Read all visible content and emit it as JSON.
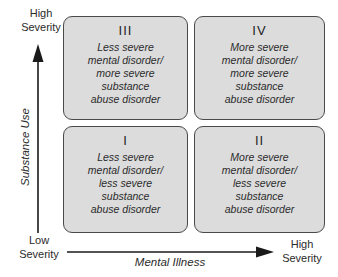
{
  "quadrants": {
    "iii": {
      "numeral": "III",
      "lines": [
        "Less severe",
        "mental disorder/",
        "more severe",
        "substance",
        "abuse disorder"
      ]
    },
    "iv": {
      "numeral": "IV",
      "lines": [
        "More severe",
        "mental disorder/",
        "more severe",
        "substance",
        "abuse disorder"
      ]
    },
    "i": {
      "numeral": "I",
      "lines": [
        "Less severe",
        "mental disorder/",
        "less severe",
        "substance",
        "abuse disorder"
      ]
    },
    "ii": {
      "numeral": "II",
      "lines": [
        "More severe",
        "mental disorder/",
        "less severe",
        "substance",
        "abuse disorder"
      ]
    }
  },
  "axes": {
    "y": {
      "name": "Substance Use",
      "top_label_line1": "High",
      "top_label_line2": "Severity",
      "bottom_label_line1": "Low",
      "bottom_label_line2": "Severity"
    },
    "x": {
      "name": "Mental Illness",
      "right_label_line1": "High",
      "right_label_line2": "Severity"
    }
  },
  "colors": {
    "box_fill": "#dcdcdc",
    "box_border": "#4a4a4a",
    "arrow": "#1a1a1a",
    "text": "#2b2b2b",
    "background": "#ffffff"
  }
}
